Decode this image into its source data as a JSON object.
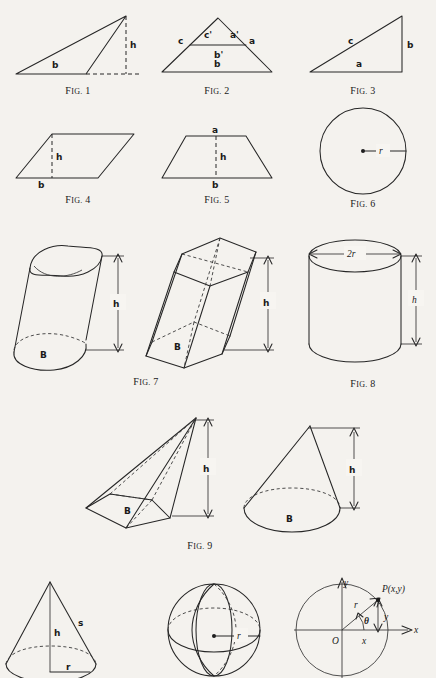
{
  "page": {
    "background": "#f4f2ee",
    "ink": "#262626"
  },
  "figures": [
    {
      "id": "fig1",
      "caption": "Fig. 1",
      "caption_prefix": "F",
      "caption_small": "IG.",
      "caption_number": "1",
      "shape": "obtuse-triangle-with-external-altitude",
      "labels": [
        "b",
        "h"
      ]
    },
    {
      "id": "fig2",
      "caption": "Fig. 2",
      "caption_number": "2",
      "shape": "triangle-with-similar-inner-triangle",
      "labels": [
        "c",
        "c'",
        "a'",
        "a",
        "b'",
        "b"
      ]
    },
    {
      "id": "fig3",
      "caption": "Fig. 3",
      "caption_number": "3",
      "shape": "right-triangle",
      "labels": [
        "c",
        "b",
        "a"
      ]
    },
    {
      "id": "fig4",
      "caption": "Fig. 4",
      "caption_number": "4",
      "shape": "parallelogram-with-altitude",
      "labels": [
        "h",
        "b"
      ]
    },
    {
      "id": "fig5",
      "caption": "Fig. 5",
      "caption_number": "5",
      "shape": "trapezoid-with-altitude",
      "labels": [
        "a",
        "h",
        "b"
      ]
    },
    {
      "id": "fig6",
      "caption": "Fig. 6",
      "caption_number": "6",
      "shape": "circle-with-radius",
      "labels": [
        "r"
      ]
    },
    {
      "id": "fig7",
      "caption": "Fig. 7",
      "caption_number": "7",
      "shape": "oblique-cylinder-and-oblique-hexagonal-prism",
      "labels": [
        "h",
        "B",
        "h",
        "B"
      ]
    },
    {
      "id": "fig8",
      "caption": "Fig. 8",
      "caption_number": "8",
      "shape": "right-circular-cylinder",
      "labels": [
        "2r",
        "h"
      ]
    },
    {
      "id": "fig9",
      "caption": "Fig. 9",
      "caption_number": "9",
      "shape": "oblique-pyramid-and-oblique-cone",
      "labels": [
        "h",
        "B",
        "h",
        "B"
      ]
    },
    {
      "id": "fig10",
      "caption": "",
      "caption_number": "",
      "shape": "right-circular-cone-with-slant-height",
      "labels": [
        "h",
        "s",
        "r"
      ]
    },
    {
      "id": "fig11",
      "caption": "",
      "caption_number": "",
      "shape": "sphere-with-radius",
      "labels": [
        "r"
      ]
    },
    {
      "id": "fig12",
      "caption": "",
      "caption_number": "",
      "shape": "unit-circle-trig-diagram",
      "labels": [
        "y",
        "x",
        "O",
        "r",
        "y",
        "x",
        "P(x,y)",
        "θ"
      ]
    }
  ],
  "text": {
    "fig_word": "F",
    "fig_word_small": "IG.",
    "b": "b",
    "h": "h",
    "c": "c",
    "c_prime": "c'",
    "a": "a",
    "a_prime": "a'",
    "b_prime": "b'",
    "r": "r",
    "two_r": "2r",
    "B": "B",
    "s": "s",
    "x": "x",
    "y": "y",
    "O": "O",
    "theta": "θ",
    "point_label": "P(x,y)"
  }
}
